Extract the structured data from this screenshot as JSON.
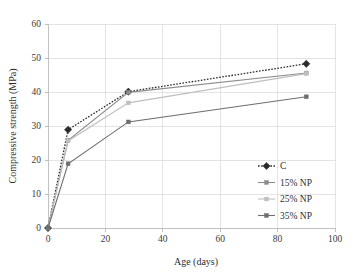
{
  "chart_data": {
    "type": "line",
    "title": "",
    "xlabel": "Age (days)",
    "ylabel": "Compressive strength (MPa)",
    "xlim": [
      0,
      100
    ],
    "ylim": [
      0,
      60
    ],
    "xticks": [
      0,
      20,
      40,
      60,
      80,
      100
    ],
    "yticks": [
      0,
      10,
      20,
      30,
      40,
      50,
      60
    ],
    "grid": true,
    "legend_position": "center-right",
    "x": [
      0,
      7,
      28,
      90
    ],
    "series": [
      {
        "name": "C",
        "values": [
          0,
          28.9,
          40.1,
          48.3
        ],
        "color": "#2b2b2b",
        "linestyle": "dotted",
        "marker": "diamond"
      },
      {
        "name": "15% NP",
        "values": [
          0,
          25.8,
          39.9,
          45.6
        ],
        "color": "#8c8c8c",
        "linestyle": "solid",
        "marker": "square"
      },
      {
        "name": "25% NP",
        "values": [
          0,
          25.6,
          36.8,
          45.4
        ],
        "color": "#bfbfbf",
        "linestyle": "solid",
        "marker": "square"
      },
      {
        "name": "35% NP",
        "values": [
          0,
          18.9,
          31.2,
          38.6
        ],
        "color": "#6e6e6e",
        "linestyle": "solid",
        "marker": "square"
      }
    ]
  },
  "axes": {
    "y_tick_labels": [
      "0",
      "10",
      "20",
      "30",
      "40",
      "50",
      "60"
    ],
    "x_tick_labels": [
      "0",
      "20",
      "40",
      "60",
      "80",
      "100"
    ],
    "x_axis_title": "Age (days)",
    "y_axis_title": "Compressive strength (MPa)"
  },
  "legend": {
    "items": [
      {
        "label": "C"
      },
      {
        "label": "15% NP"
      },
      {
        "label": "25% NP"
      },
      {
        "label": "35% NP"
      }
    ]
  }
}
